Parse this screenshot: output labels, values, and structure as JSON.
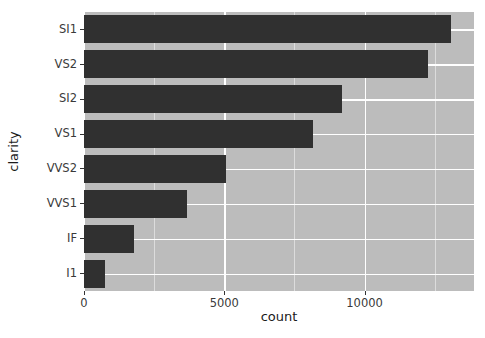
{
  "chart_data": {
    "type": "bar",
    "orientation": "horizontal",
    "title": "",
    "xlabel": "count",
    "ylabel": "clarity",
    "categories": [
      "SI1",
      "VS2",
      "SI2",
      "VS1",
      "VVS2",
      "VVS1",
      "IF",
      "I1"
    ],
    "values": [
      13065,
      12258,
      9194,
      8171,
      5066,
      3655,
      1790,
      741
    ],
    "xlim": [
      0,
      13900
    ],
    "ylim": [
      0,
      8
    ],
    "xticks": [
      0,
      5000,
      10000
    ],
    "xticklabels": [
      "0",
      "5000",
      "10000"
    ],
    "xminorticks": [
      2500,
      7500,
      12500
    ],
    "grid": true,
    "legend": false,
    "bar_color": "#303030",
    "panel_background": "#bcbcbc",
    "gridline_color": "#ffffff",
    "minor_gridline_color": "#dcdcdc"
  },
  "axes": {
    "x_title": "count",
    "y_title": "clarity"
  },
  "ticks": {
    "x": [
      {
        "value": 0,
        "label": "0"
      },
      {
        "value": 5000,
        "label": "5000"
      },
      {
        "value": 10000,
        "label": "10000"
      }
    ],
    "y": [
      {
        "label": "SI1"
      },
      {
        "label": "VS2"
      },
      {
        "label": "SI2"
      },
      {
        "label": "VS1"
      },
      {
        "label": "VVS2"
      },
      {
        "label": "VVS1"
      },
      {
        "label": "IF"
      },
      {
        "label": "I1"
      }
    ]
  }
}
